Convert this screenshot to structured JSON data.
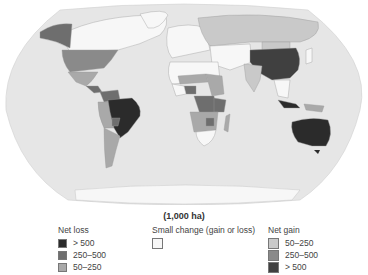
{
  "map": {
    "title_unit": "(1,000 ha)",
    "colors": {
      "ocean": "#e6e6e6",
      "land_neutral": "#f7f7f7",
      "loss_high": "#2b2b2b",
      "loss_mid": "#6e6e6e",
      "loss_low": "#a9a9a9",
      "gain_low": "#c9c9c9",
      "gain_mid": "#8a8a8a",
      "gain_high": "#404040"
    },
    "regions": [
      {
        "name": "Brazil",
        "class": "Net loss > 500"
      },
      {
        "name": "Australia",
        "class": "Net loss > 500"
      },
      {
        "name": "China",
        "class": "Net gain > 500"
      },
      {
        "name": "United States",
        "class": "Net gain 250–500"
      },
      {
        "name": "Russia",
        "class": "Net gain 50–250"
      },
      {
        "name": "Indonesia",
        "class": "Net loss > 500"
      },
      {
        "name": "DR Congo",
        "class": "Net loss 250–500"
      }
    ]
  },
  "legend": {
    "net_loss": {
      "title": "Net loss",
      "items": [
        {
          "label": "> 500",
          "color": "#2b2b2b"
        },
        {
          "label": "250–500",
          "color": "#6e6e6e"
        },
        {
          "label": "50–250",
          "color": "#a9a9a9"
        }
      ]
    },
    "small_change": {
      "title": "Small change (gain or loss)",
      "items": [
        {
          "label": "",
          "color": "#f7f7f7"
        }
      ]
    },
    "net_gain": {
      "title": "Net gain",
      "items": [
        {
          "label": "50–250",
          "color": "#c9c9c9"
        },
        {
          "label": "250–500",
          "color": "#8a8a8a"
        },
        {
          "label": "> 500",
          "color": "#404040"
        }
      ]
    }
  }
}
